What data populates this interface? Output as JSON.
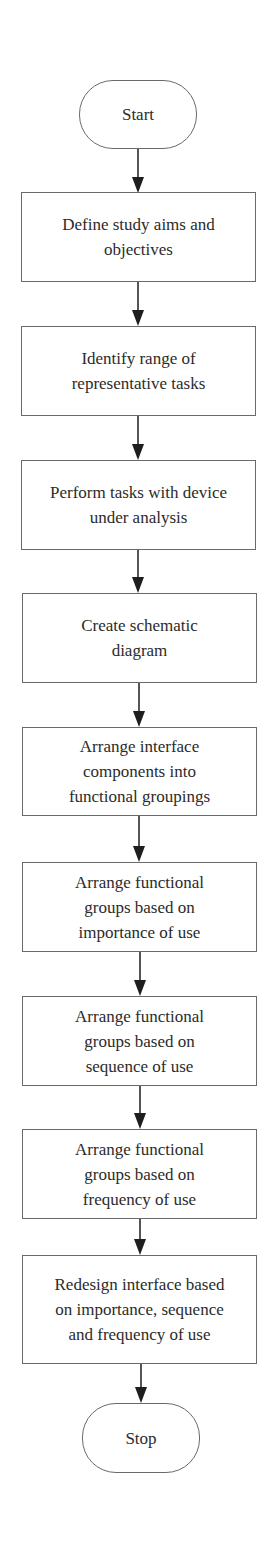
{
  "flowchart": {
    "start": {
      "label": "Start"
    },
    "steps": [
      {
        "label": "Define study aims and objectives"
      },
      {
        "label": "Identify range of representative tasks"
      },
      {
        "label": "Perform tasks with device under analysis"
      },
      {
        "label": "Create schematic diagram"
      },
      {
        "label": "Arrange interface components into functional groupings"
      },
      {
        "label": "Arrange functional groups based on importance of use"
      },
      {
        "label": "Arrange functional groups based on sequence of use"
      },
      {
        "label": "Arrange functional groups based on frequency of use"
      },
      {
        "label": "Redesign interface based on importance, sequence and frequency of use"
      }
    ],
    "stop": {
      "label": "Stop"
    }
  },
  "colors": {
    "border": "#6a6a6a",
    "arrow": "#1e1e1e",
    "text": "#2b2b2b",
    "background": "#ffffff"
  }
}
